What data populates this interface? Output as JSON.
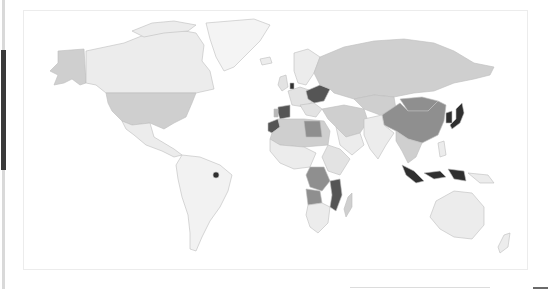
{
  "map": {
    "type": "choropleth",
    "projection": "world",
    "legend_visible": false,
    "colors": {
      "background": "#ffffff",
      "ocean": "#ffffff",
      "border": "#bdbdbd",
      "level_0": "#f2f2f2",
      "level_1": "#e3e3e3",
      "level_2": "#cfcfcf",
      "level_3": "#b8b8b8",
      "level_4": "#8f8f8f",
      "level_5": "#555555",
      "level_6": "#2f2f2f"
    },
    "regions": [
      {
        "name": "Canada",
        "level": 1
      },
      {
        "name": "Alaska (USA)",
        "level": 3
      },
      {
        "name": "United States",
        "level": 3
      },
      {
        "name": "Greenland",
        "level": 0
      },
      {
        "name": "Mexico",
        "level": 1
      },
      {
        "name": "Central America",
        "level": 0
      },
      {
        "name": "South America",
        "level": 0
      },
      {
        "name": "French Guiana",
        "level": 6
      },
      {
        "name": "Russia",
        "level": 2
      },
      {
        "name": "Scandinavia",
        "level": 1
      },
      {
        "name": "Western Europe",
        "level": 1
      },
      {
        "name": "Netherlands",
        "level": 6
      },
      {
        "name": "Ukraine / Eastern Europe",
        "level": 5
      },
      {
        "name": "Spain",
        "level": 5
      },
      {
        "name": "Portugal",
        "level": 3
      },
      {
        "name": "Turkey / Middle East",
        "level": 2
      },
      {
        "name": "Kazakhstan / Central Asia",
        "level": 2
      },
      {
        "name": "Mongolia",
        "level": 4
      },
      {
        "name": "China",
        "level": 4
      },
      {
        "name": "South Korea",
        "level": 6
      },
      {
        "name": "Japan",
        "level": 6
      },
      {
        "name": "India / South Asia",
        "level": 1
      },
      {
        "name": "Southeast Asia mainland",
        "level": 2
      },
      {
        "name": "Indonesia",
        "level": 6
      },
      {
        "name": "Philippines",
        "level": 1
      },
      {
        "name": "Australia",
        "level": 1
      },
      {
        "name": "New Zealand",
        "level": 1
      },
      {
        "name": "Morocco",
        "level": 5
      },
      {
        "name": "Libya",
        "level": 4
      },
      {
        "name": "North Africa",
        "level": 2
      },
      {
        "name": "West Africa",
        "level": 1
      },
      {
        "name": "DR Congo",
        "level": 4
      },
      {
        "name": "Angola",
        "level": 4
      },
      {
        "name": "Tanzania / Mozambique",
        "level": 5
      },
      {
        "name": "Southern Africa",
        "level": 1
      },
      {
        "name": "East Africa",
        "level": 1
      },
      {
        "name": "Madagascar",
        "level": 2
      }
    ]
  },
  "scrollbar": {
    "orientation": "vertical",
    "position": "left"
  }
}
